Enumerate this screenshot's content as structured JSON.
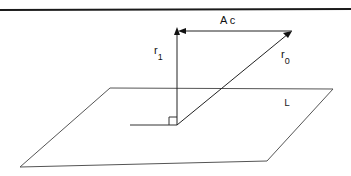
{
  "diagram": {
    "labels": {
      "ac": "A c",
      "r1_base": "r",
      "r1_sub": "1",
      "r0_base": "r",
      "r0_sub": "0",
      "plane": "L"
    },
    "elements": [
      {
        "name": "top-rule",
        "type": "line",
        "from": [
          0,
          10
        ],
        "to": [
          351,
          9
        ]
      },
      {
        "name": "plane-L",
        "type": "parallelogram",
        "points": [
          [
            110,
            88
          ],
          [
            333,
            89
          ],
          [
            267,
            161
          ],
          [
            20,
            167
          ]
        ]
      },
      {
        "name": "vector-r1",
        "type": "arrow",
        "from": [
          177,
          124
        ],
        "to": [
          177,
          30
        ]
      },
      {
        "name": "vector-r0",
        "type": "arrow",
        "from": [
          177,
          124
        ],
        "to": [
          292,
          31
        ]
      },
      {
        "name": "vector-Ac",
        "type": "arrow",
        "from": [
          292,
          31
        ],
        "to": [
          177,
          31
        ]
      },
      {
        "name": "base-line",
        "type": "line",
        "from": [
          130,
          125
        ],
        "to": [
          177,
          125
        ]
      },
      {
        "name": "right-angle-marker",
        "type": "square",
        "x": 169,
        "y": 117,
        "size": 8
      }
    ],
    "colors": {
      "stroke": "#1a1a1a",
      "plane_stroke": "#555555",
      "background": "#ffffff"
    }
  }
}
